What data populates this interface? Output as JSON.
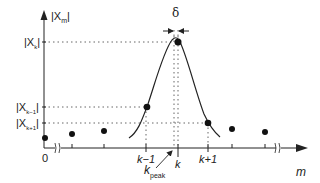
{
  "diagram": {
    "y_axis": {
      "label_main": "|X",
      "label_sub": "m",
      "label_close": "|"
    },
    "x_axis": {
      "label": "m"
    },
    "y_levels": [
      {
        "name": "peak",
        "main": "|X",
        "sub": "k",
        "close": "|"
      },
      {
        "name": "left",
        "main": "|X",
        "sub": "k−1",
        "close": "|"
      },
      {
        "name": "right",
        "main": "|X",
        "sub": "k+1",
        "close": "|"
      }
    ],
    "x_ticks": {
      "origin": "0",
      "k_minus_1": "k−1",
      "k": "k",
      "k_plus_1": "k+1"
    },
    "annotations": {
      "delta": "δ",
      "k_peak_main": "k",
      "k_peak_sub": "peak"
    },
    "colors": {
      "ink": "#222222",
      "dotted": "#555555",
      "background": "#ffffff"
    }
  }
}
